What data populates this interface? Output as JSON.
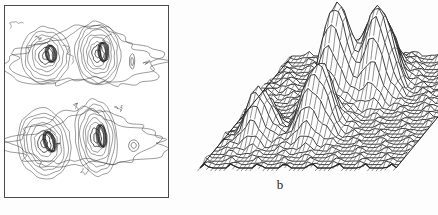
{
  "figure": {
    "background_color": "#fdfdfd",
    "ink_color": "#222222",
    "panels": [
      {
        "id": "a",
        "label": "",
        "type": "contour-map",
        "frame": {
          "border_color": "#4a4a4a",
          "fill": "#ffffff"
        }
      },
      {
        "id": "b",
        "label": "b",
        "type": "surface-mesh-3d"
      }
    ]
  },
  "chart_data": [
    {
      "type": "contour",
      "title": "",
      "subtitle": "",
      "xlabel": "",
      "ylabel": "",
      "grid": false,
      "legend": "none",
      "xlim": [
        0,
        100
      ],
      "ylim": [
        0,
        100
      ],
      "frame_visible": true,
      "contour_levels": [
        1,
        2,
        3,
        4,
        5,
        6,
        7,
        8
      ],
      "level_label_text": "",
      "peaks": [
        {
          "name": "upper-left-peak",
          "x": 24,
          "y": 72,
          "rings": 8,
          "rx": 16,
          "ry": 19,
          "rotation": -22
        },
        {
          "name": "upper-right-peak",
          "x": 56,
          "y": 69,
          "rings": 8,
          "rx": 13,
          "ry": 20,
          "rotation": -8
        },
        {
          "name": "lower-left-peak",
          "x": 25,
          "y": 26,
          "rings": 7,
          "rx": 15,
          "ry": 15,
          "rotation": -10
        },
        {
          "name": "lower-right-peak",
          "x": 57,
          "y": 25,
          "rings": 8,
          "rx": 14,
          "ry": 17,
          "rotation": -5
        }
      ],
      "isolated_features": [
        {
          "name": "small-blob-upper",
          "x": 79,
          "y": 73,
          "rx": 3.2,
          "ry": 3.0
        },
        {
          "name": "small-blob-lower",
          "x": 78,
          "y": 29,
          "rx": 1.6,
          "ry": 4.2
        }
      ],
      "outer_contour_note": "irregular outermost contour enclosing both upper and both lower peak groups"
    },
    {
      "type": "surface",
      "title": "",
      "subtitle": "",
      "xlabel": "",
      "ylabel": "",
      "zlabel": "",
      "grid": false,
      "legend": "none",
      "projection": "oblique-parallelogram",
      "mesh_rows": 34,
      "mesh_cols": 46,
      "base_corners": [
        [
          10,
          132
        ],
        [
          150,
          12
        ],
        [
          240,
          12
        ],
        [
          100,
          132
        ]
      ],
      "peaks": [
        {
          "name": "left-small-peak",
          "u": 0.16,
          "v": 0.3,
          "height": 0.52,
          "width": 0.055
        },
        {
          "name": "center-tall-peak",
          "u": 0.4,
          "v": 0.62,
          "height": 1.0,
          "width": 0.06
        },
        {
          "name": "mid-front-peak",
          "u": 0.44,
          "v": 0.34,
          "height": 0.74,
          "width": 0.065
        },
        {
          "name": "right-peak",
          "u": 0.6,
          "v": 0.66,
          "height": 0.78,
          "width": 0.058
        },
        {
          "name": "far-ridge-peak",
          "u": 0.53,
          "v": 0.8,
          "height": 0.6,
          "width": 0.07
        }
      ],
      "noise_amplitude": 0.06,
      "zlim": [
        0,
        1
      ]
    }
  ]
}
